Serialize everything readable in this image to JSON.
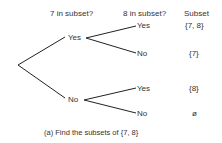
{
  "headers": {
    "col1": "7 in subset?",
    "col2": "8 in subset?",
    "col3": "Subset"
  },
  "tree": {
    "level1": [
      {
        "label": "Yes"
      },
      {
        "label": "No"
      }
    ],
    "level2": [
      {
        "label": "Yes",
        "subset": "{7, 8}"
      },
      {
        "label": "No",
        "subset": "{7}"
      },
      {
        "label": "Yes",
        "subset": "{8}"
      },
      {
        "label": "No",
        "subset": "ø"
      }
    ]
  },
  "caption": "(a)  Find the subsets of  {7, 8}"
}
